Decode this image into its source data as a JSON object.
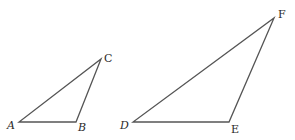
{
  "diagram": {
    "colors": {
      "stroke": "#555555",
      "label": "#2a2a2a",
      "background": "#ffffff"
    },
    "triangles": [
      {
        "name": "ABC",
        "vertices": {
          "A": {
            "x": 19,
            "y": 122,
            "label": "A",
            "lx": 7,
            "ly": 129,
            "italic": true
          },
          "B": {
            "x": 76,
            "y": 122,
            "label": "B",
            "lx": 78,
            "ly": 131,
            "italic": true
          },
          "C": {
            "x": 101,
            "y": 59,
            "label": "C",
            "lx": 104,
            "ly": 62,
            "italic": false
          }
        }
      },
      {
        "name": "DEF",
        "vertices": {
          "D": {
            "x": 133,
            "y": 122,
            "label": "D",
            "lx": 120,
            "ly": 129,
            "italic": true
          },
          "E": {
            "x": 229,
            "y": 122,
            "label": "E",
            "lx": 231,
            "ly": 133,
            "italic": false
          },
          "F": {
            "x": 274,
            "y": 18,
            "label": "F",
            "lx": 278,
            "ly": 18,
            "italic": false
          }
        }
      }
    ]
  }
}
